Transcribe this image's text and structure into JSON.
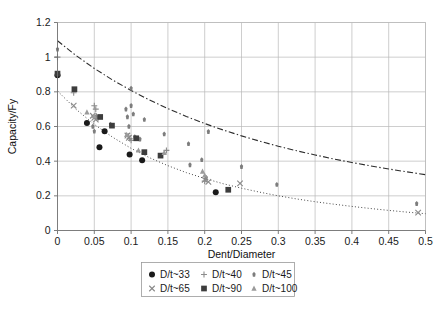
{
  "chart_data": {
    "type": "scatter",
    "title": "",
    "xlabel": "Dent/Diameter",
    "ylabel": "Capacity/Fy",
    "xlim": [
      0,
      0.5
    ],
    "ylim": [
      0,
      1.2
    ],
    "xticks": [
      "0",
      "0.05",
      "0.1",
      "0.15",
      "0.2",
      "0.25",
      "0.3",
      "0.35",
      "0.4",
      "0.45",
      "0.5"
    ],
    "xtick_values": [
      0,
      0.05,
      0.1,
      0.15,
      0.2,
      0.25,
      0.3,
      0.35,
      0.4,
      0.45,
      0.5
    ],
    "yticks": [
      "0",
      "0.2",
      "0.4",
      "0.6",
      "0.8",
      "1",
      "1.2"
    ],
    "ytick_values": [
      0,
      0.2,
      0.4,
      0.6,
      0.8,
      1.0,
      1.2
    ],
    "grid": true,
    "legend_position": "below-center",
    "series": [
      {
        "name": "D/t~33",
        "marker": "circle",
        "color": "#1a1a1a",
        "points": [
          [
            0.0,
            0.895
          ],
          [
            0.04,
            0.62
          ],
          [
            0.057,
            0.48
          ],
          [
            0.064,
            0.572
          ],
          [
            0.098,
            0.438
          ],
          [
            0.115,
            0.405
          ],
          [
            0.215,
            0.221
          ]
        ]
      },
      {
        "name": "D/t~40",
        "marker": "plus",
        "color": "#8c8c8c",
        "points": [
          [
            0.0,
            1.0
          ],
          [
            0.05,
            0.72
          ],
          [
            0.052,
            0.7
          ],
          [
            0.053,
            0.66
          ],
          [
            0.055,
            0.648
          ],
          [
            0.096,
            0.545
          ],
          [
            0.098,
            0.53
          ],
          [
            0.1,
            0.52
          ],
          [
            0.148,
            0.462
          ],
          [
            0.2,
            0.285
          ],
          [
            0.022,
            0.795
          ]
        ]
      },
      {
        "name": "D/t~45",
        "marker": "diamond",
        "color": "#7d7d7d",
        "points": [
          [
            0.0,
            1.045
          ],
          [
            0.048,
            0.6
          ],
          [
            0.05,
            0.572
          ],
          [
            0.052,
            0.655
          ],
          [
            0.072,
            0.612
          ],
          [
            0.093,
            0.7
          ],
          [
            0.095,
            0.655
          ],
          [
            0.097,
            0.6
          ],
          [
            0.1,
            0.72
          ],
          [
            0.103,
            0.672
          ],
          [
            0.105,
            0.54
          ],
          [
            0.112,
            0.527
          ],
          [
            0.118,
            0.64
          ],
          [
            0.1,
            0.82
          ],
          [
            0.145,
            0.556
          ],
          [
            0.18,
            0.378
          ],
          [
            0.178,
            0.5
          ],
          [
            0.196,
            0.408
          ],
          [
            0.205,
            0.57
          ],
          [
            0.202,
            0.305
          ],
          [
            0.25,
            0.368
          ],
          [
            0.298,
            0.265
          ],
          [
            0.488,
            0.155
          ]
        ]
      },
      {
        "name": "D/t~65",
        "marker": "cross",
        "color": "#8a8a8a",
        "points": [
          [
            0.022,
            0.72
          ],
          [
            0.048,
            0.662
          ],
          [
            0.05,
            0.65
          ],
          [
            0.052,
            0.64
          ],
          [
            0.095,
            0.548
          ],
          [
            0.097,
            0.535
          ],
          [
            0.2,
            0.292
          ],
          [
            0.205,
            0.28
          ],
          [
            0.248,
            0.272
          ],
          [
            0.49,
            0.103
          ]
        ]
      },
      {
        "name": "D/t~90",
        "marker": "square",
        "color": "#3d3d3d",
        "points": [
          [
            0.0,
            0.905
          ],
          [
            0.023,
            0.815
          ],
          [
            0.058,
            0.655
          ],
          [
            0.074,
            0.605
          ],
          [
            0.107,
            0.532
          ],
          [
            0.118,
            0.452
          ],
          [
            0.14,
            0.432
          ],
          [
            0.232,
            0.235
          ]
        ]
      },
      {
        "name": "D/t~100",
        "marker": "triangle",
        "color": "#9a9a9a",
        "points": [
          [
            0.04,
            0.682
          ],
          [
            0.05,
            0.66
          ],
          [
            0.094,
            0.552
          ],
          [
            0.11,
            0.462
          ],
          [
            0.145,
            0.448
          ],
          [
            0.197,
            0.34
          ],
          [
            0.2,
            0.318
          ]
        ]
      }
    ],
    "curves": [
      {
        "name": "upper-bound-curve",
        "style": "dash-dot",
        "color": "#2b2b2b",
        "points": [
          [
            0.0,
            1.095
          ],
          [
            0.025,
            1.01
          ],
          [
            0.05,
            0.935
          ],
          [
            0.075,
            0.868
          ],
          [
            0.1,
            0.808
          ],
          [
            0.125,
            0.753
          ],
          [
            0.15,
            0.703
          ],
          [
            0.175,
            0.658
          ],
          [
            0.2,
            0.617
          ],
          [
            0.225,
            0.58
          ],
          [
            0.25,
            0.546
          ],
          [
            0.275,
            0.515
          ],
          [
            0.3,
            0.486
          ],
          [
            0.325,
            0.46
          ],
          [
            0.35,
            0.436
          ],
          [
            0.375,
            0.413
          ],
          [
            0.4,
            0.392
          ],
          [
            0.425,
            0.373
          ],
          [
            0.45,
            0.355
          ],
          [
            0.475,
            0.338
          ],
          [
            0.5,
            0.322
          ]
        ]
      },
      {
        "name": "lower-bound-curve",
        "style": "dotted",
        "color": "#4a4a4a",
        "points": [
          [
            0.0,
            0.805
          ],
          [
            0.025,
            0.7
          ],
          [
            0.05,
            0.612
          ],
          [
            0.075,
            0.538
          ],
          [
            0.1,
            0.474
          ],
          [
            0.125,
            0.42
          ],
          [
            0.15,
            0.374
          ],
          [
            0.175,
            0.334
          ],
          [
            0.2,
            0.3
          ],
          [
            0.225,
            0.27
          ],
          [
            0.25,
            0.244
          ],
          [
            0.275,
            0.221
          ],
          [
            0.3,
            0.2
          ],
          [
            0.325,
            0.182
          ],
          [
            0.35,
            0.166
          ],
          [
            0.375,
            0.152
          ],
          [
            0.4,
            0.139
          ],
          [
            0.425,
            0.127
          ],
          [
            0.45,
            0.116
          ],
          [
            0.475,
            0.106
          ],
          [
            0.5,
            0.097
          ]
        ]
      }
    ],
    "legend": [
      {
        "label": "D/t~33",
        "marker": "circle",
        "color": "#1a1a1a"
      },
      {
        "label": "D/t~40",
        "marker": "plus",
        "color": "#8c8c8c"
      },
      {
        "label": "D/t~45",
        "marker": "diamond",
        "color": "#7d7d7d"
      },
      {
        "label": "D/t~65",
        "marker": "cross",
        "color": "#8a8a8a"
      },
      {
        "label": "D/t~90",
        "marker": "square",
        "color": "#3d3d3d"
      },
      {
        "label": "D/t~100",
        "marker": "triangle",
        "color": "#9a9a9a"
      }
    ]
  }
}
